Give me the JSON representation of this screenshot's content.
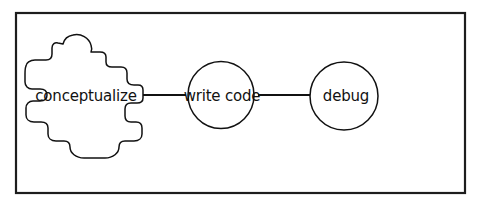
{
  "diagram": {
    "type": "flowchart",
    "orientation": "horizontal",
    "background_color": "#ffffff",
    "stroke_color": "#111111",
    "frame": {
      "label": "diagram-frame",
      "x": 15,
      "y": 12,
      "width": 450,
      "height": 181,
      "stroke_width": 2,
      "color": "#1d1d1d"
    },
    "nodes": [
      {
        "id": "conceptualize",
        "label": "conceptualize",
        "shape": "blob",
        "cx": 83,
        "cy": 95,
        "rx": 62,
        "ry": 62,
        "font_size": 15,
        "stroke_width": 1.4
      },
      {
        "id": "write-code",
        "label": "write code",
        "shape": "circle",
        "cx": 221,
        "cy": 95,
        "rx": 33,
        "ry": 33,
        "font_size": 15,
        "stroke_width": 1.4
      },
      {
        "id": "debug",
        "label": "debug",
        "shape": "circle",
        "cx": 344,
        "cy": 96,
        "rx": 34,
        "ry": 34,
        "font_size": 15,
        "stroke_width": 1.4
      }
    ],
    "connectors": [
      {
        "id": "conceptualize-to-write-code",
        "from": "conceptualize",
        "to": "write-code",
        "x1": 148,
        "y1": 95,
        "x2": 186,
        "y2": 95,
        "stroke_width": 1.6,
        "arrow": false
      },
      {
        "id": "write-code-to-debug",
        "from": "write-code",
        "to": "debug",
        "x1": 266,
        "y1": 95,
        "x2": 310,
        "y2": 95,
        "stroke_width": 1.6,
        "arrow": false
      }
    ]
  }
}
